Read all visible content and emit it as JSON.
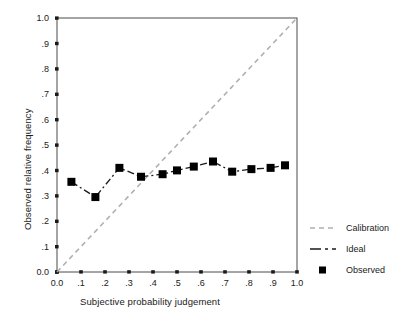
{
  "chart_data": {
    "type": "line",
    "title": "",
    "xlabel": "Subjective probability judgement",
    "ylabel": "Observed relative frequency",
    "xlim": [
      0.0,
      1.0
    ],
    "ylim": [
      0.0,
      1.0
    ],
    "grid": false,
    "legend_position": "right",
    "xticks": [
      "0.0",
      ".1",
      ".2",
      ".3",
      ".4",
      ".5",
      ".6",
      ".7",
      ".8",
      ".9",
      "1.0"
    ],
    "xtick_values": [
      0.0,
      0.1,
      0.2,
      0.3,
      0.4,
      0.5,
      0.6,
      0.7,
      0.8,
      0.9,
      1.0
    ],
    "yticks": [
      "0.0",
      ".1",
      ".2",
      ".3",
      ".4",
      ".5",
      ".6",
      ".7",
      ".8",
      ".9",
      "1.0"
    ],
    "ytick_values": [
      0.0,
      0.1,
      0.2,
      0.3,
      0.4,
      0.5,
      0.6,
      0.7,
      0.8,
      0.9,
      1.0
    ],
    "series": [
      {
        "name": "Calibration",
        "style": "dashed",
        "color": "#b0b0b0",
        "x": [
          0.0,
          1.0
        ],
        "values": [
          0.0,
          1.0
        ]
      },
      {
        "name": "Ideal",
        "style": "dash-dot",
        "color": "#1a1a1a",
        "x": [
          0.06,
          0.16,
          0.26,
          0.35,
          0.44,
          0.5,
          0.57,
          0.65,
          0.73,
          0.81,
          0.89,
          0.95
        ],
        "values": [
          0.355,
          0.295,
          0.41,
          0.375,
          0.385,
          0.4,
          0.415,
          0.435,
          0.395,
          0.405,
          0.41,
          0.42
        ]
      },
      {
        "name": "Observed",
        "style": "marker-square",
        "color": "#000000",
        "x": [
          0.06,
          0.16,
          0.26,
          0.35,
          0.44,
          0.5,
          0.57,
          0.65,
          0.73,
          0.81,
          0.89,
          0.95
        ],
        "values": [
          0.355,
          0.295,
          0.41,
          0.375,
          0.385,
          0.4,
          0.415,
          0.435,
          0.395,
          0.405,
          0.41,
          0.42
        ]
      }
    ],
    "legend": [
      {
        "label": "Calibration",
        "marker": "dashed-line",
        "color": "#b0b0b0"
      },
      {
        "label": "Ideal",
        "marker": "dash-dot-line",
        "color": "#1a1a1a"
      },
      {
        "label": "Observed",
        "marker": "filled-square",
        "color": "#000000"
      }
    ]
  }
}
